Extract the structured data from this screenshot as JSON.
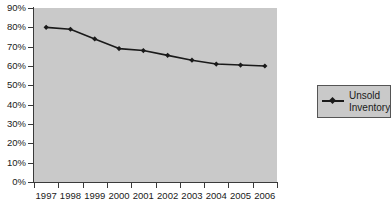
{
  "chart_data": {
    "type": "line",
    "title": "",
    "xlabel": "",
    "ylabel": "",
    "categories": [
      "1997",
      "1998",
      "1999",
      "2000",
      "2001",
      "2002",
      "2003",
      "2004",
      "2005",
      "2006"
    ],
    "series": [
      {
        "name": "Unsold Inventory",
        "values": [
          80,
          79,
          74,
          69,
          68,
          65.5,
          63,
          61,
          60.5,
          60
        ]
      }
    ],
    "ylim": [
      0,
      90
    ],
    "ytick_labels": [
      "0%",
      "10%",
      "20%",
      "30%",
      "40%",
      "50%",
      "60%",
      "70%",
      "80%",
      "90%"
    ],
    "ytick_values": [
      0,
      10,
      20,
      30,
      40,
      50,
      60,
      70,
      80,
      90
    ],
    "grid": false,
    "legend_position": "right",
    "colors": {
      "line": "#1a1a1a",
      "marker": "#1a1a1a",
      "plot_background": "#c9c9c9",
      "legend_background": "#c9c9c9",
      "legend_border": "#555555",
      "axis": "#3a3a3a",
      "page_background": "#ffffff",
      "text": "#1a1a1a"
    }
  },
  "legend": {
    "entries": [
      {
        "label_line1": "Unsold",
        "label_line2": "Inventory",
        "marker": "diamond-marker"
      }
    ]
  }
}
